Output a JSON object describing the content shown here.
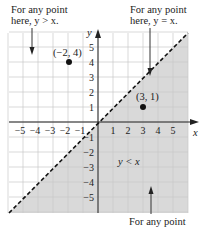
{
  "graph": {
    "x_range": [
      -5,
      5
    ],
    "y_range": [
      -5,
      5
    ],
    "x_axis_label": "x",
    "y_axis_label": "y",
    "x_tick_labels": [
      "−5",
      "−4",
      "−3",
      "−2",
      "−1",
      "1",
      "2",
      "3",
      "4",
      "5"
    ],
    "y_tick_labels": [
      "5",
      "4",
      "3",
      "2",
      "1",
      "−1",
      "−2",
      "−3",
      "−4",
      "−5"
    ],
    "boundary_line": {
      "equation": "y = x",
      "style": "dashed"
    },
    "shaded_region": {
      "label": "y < x",
      "color": "#d9d9d9"
    },
    "points": [
      {
        "label": "(−2, 4)",
        "x": -2,
        "y": 4
      },
      {
        "label": "(3, 1)",
        "x": 3,
        "y": 1
      }
    ],
    "colors": {
      "grid": "#c8c8c8",
      "axis": "#222222",
      "shade": "#d9d9d9",
      "background": "#ffffff"
    }
  },
  "annotations": {
    "top_left": {
      "line1": "For any point",
      "line2": "here, y > x."
    },
    "top_right": {
      "line1": "For any point",
      "line2": "here, y = x."
    },
    "bottom": {
      "line1": "For any point"
    }
  }
}
